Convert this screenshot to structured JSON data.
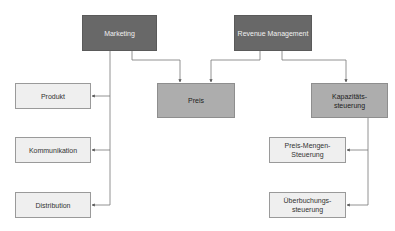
{
  "diagram": {
    "nodes": {
      "marketing": "Marketing",
      "revenue_management": "Revenue Management",
      "preis": "Preis",
      "kapazitaet_line1": "Kapazitäts-",
      "kapazitaet_line2": "steuerung",
      "produkt": "Produkt",
      "kommunikation": "Kommunikation",
      "distribution": "Distribution",
      "preis_mengen_line1": "Preis-Mengen-",
      "preis_mengen_line2": "Steuerung",
      "ueberbuchung_line1": "Überbuchungs-",
      "ueberbuchung_line2": "steuerung"
    },
    "edges": [
      {
        "from": "Marketing",
        "to": "Produkt"
      },
      {
        "from": "Marketing",
        "to": "Kommunikation"
      },
      {
        "from": "Marketing",
        "to": "Distribution"
      },
      {
        "from": "Marketing",
        "to": "Preis"
      },
      {
        "from": "Revenue Management",
        "to": "Preis"
      },
      {
        "from": "Revenue Management",
        "to": "Kapazitätssteuerung"
      },
      {
        "from": "Kapazitätssteuerung",
        "to": "Preis-Mengen-Steuerung"
      },
      {
        "from": "Kapazitätssteuerung",
        "to": "Überbuchungssteuerung"
      }
    ],
    "colors": {
      "dark": "#686868",
      "mid": "#adadad",
      "light": "#efefef",
      "line": "#666666"
    }
  }
}
